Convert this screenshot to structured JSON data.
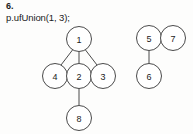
{
  "figure": {
    "problem_number": "6.",
    "code_line": "p.ufUnion(1, 3);",
    "colors": {
      "background": "#fdfdfc",
      "stroke": "#4a4a4a",
      "text": "#1b1b1b",
      "node_fill": "#ffffff"
    }
  },
  "graph": {
    "type": "union-find-forest",
    "node_radius": 12.5,
    "nodes": [
      {
        "id": "1",
        "label": "1",
        "cx": 79,
        "cy": 39
      },
      {
        "id": "4",
        "label": "4",
        "cx": 55,
        "cy": 76
      },
      {
        "id": "2",
        "label": "2",
        "cx": 79,
        "cy": 76
      },
      {
        "id": "3",
        "label": "3",
        "cx": 103,
        "cy": 76
      },
      {
        "id": "8",
        "label": "8",
        "cx": 79,
        "cy": 118
      },
      {
        "id": "5",
        "label": "5",
        "cx": 149,
        "cy": 38
      },
      {
        "id": "7",
        "label": "7",
        "cx": 173,
        "cy": 38
      },
      {
        "id": "6",
        "label": "6",
        "cx": 149,
        "cy": 76
      }
    ],
    "edges": [
      {
        "from": "1",
        "to": "4",
        "x1": 72.5,
        "y1": 50,
        "x2": 61,
        "y2": 65
      },
      {
        "from": "1",
        "to": "2",
        "x1": 79,
        "y1": 51.5,
        "x2": 79,
        "y2": 63.5
      },
      {
        "from": "1",
        "to": "3",
        "x1": 85.5,
        "y1": 50,
        "x2": 97,
        "y2": 65
      },
      {
        "from": "2",
        "to": "8",
        "x1": 79,
        "y1": 88.5,
        "x2": 79,
        "y2": 105.5
      },
      {
        "from": "5",
        "to": "6",
        "x1": 149,
        "y1": 50.5,
        "x2": 149,
        "y2": 63.5
      }
    ]
  }
}
